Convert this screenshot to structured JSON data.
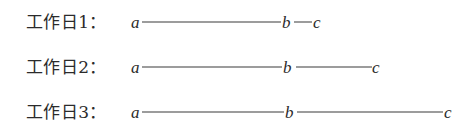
{
  "figure": {
    "background_color": "#ffffff",
    "text_color": "#2b2b2b",
    "line_color": "#3b3b3b",
    "rows": [
      {
        "label": "工作日1：",
        "nodes": [
          "a",
          "b",
          "c"
        ],
        "segments": [
          "a-b",
          "b-c"
        ]
      },
      {
        "label": "工作日2：",
        "nodes": [
          "a",
          "b",
          "c"
        ],
        "segments": [
          "a-b",
          "b-c"
        ]
      },
      {
        "label": "工作日3：",
        "nodes": [
          "a",
          "b",
          "c"
        ],
        "segments": [
          "a-b",
          "b-c"
        ]
      }
    ]
  },
  "chart_data": {
    "type": "line",
    "title": "",
    "subtitle": "",
    "xlabel": "",
    "ylabel": "",
    "categories": [
      "工作日1：",
      "工作日2：",
      "工作日3："
    ],
    "node_labels": [
      "a",
      "b",
      "c"
    ],
    "series": [
      {
        "name": "工作日1：",
        "points": [
          {
            "label": "a",
            "x": 0
          },
          {
            "label": "b",
            "x": 140
          },
          {
            "label": "c",
            "x": 170
          }
        ],
        "segment_lengths": [
          139,
          18
        ]
      },
      {
        "name": "工作日2：",
        "points": [
          {
            "label": "a",
            "x": 0
          },
          {
            "label": "b",
            "x": 141
          },
          {
            "label": "c",
            "x": 230
          }
        ],
        "segment_lengths": [
          140,
          76
        ]
      },
      {
        "name": "工作日3：",
        "points": [
          {
            "label": "a",
            "x": 0
          },
          {
            "label": "b",
            "x": 143
          },
          {
            "label": "c",
            "x": 302
          }
        ],
        "segment_lengths": [
          142,
          146
        ]
      }
    ],
    "grid": false,
    "legend": "none"
  }
}
